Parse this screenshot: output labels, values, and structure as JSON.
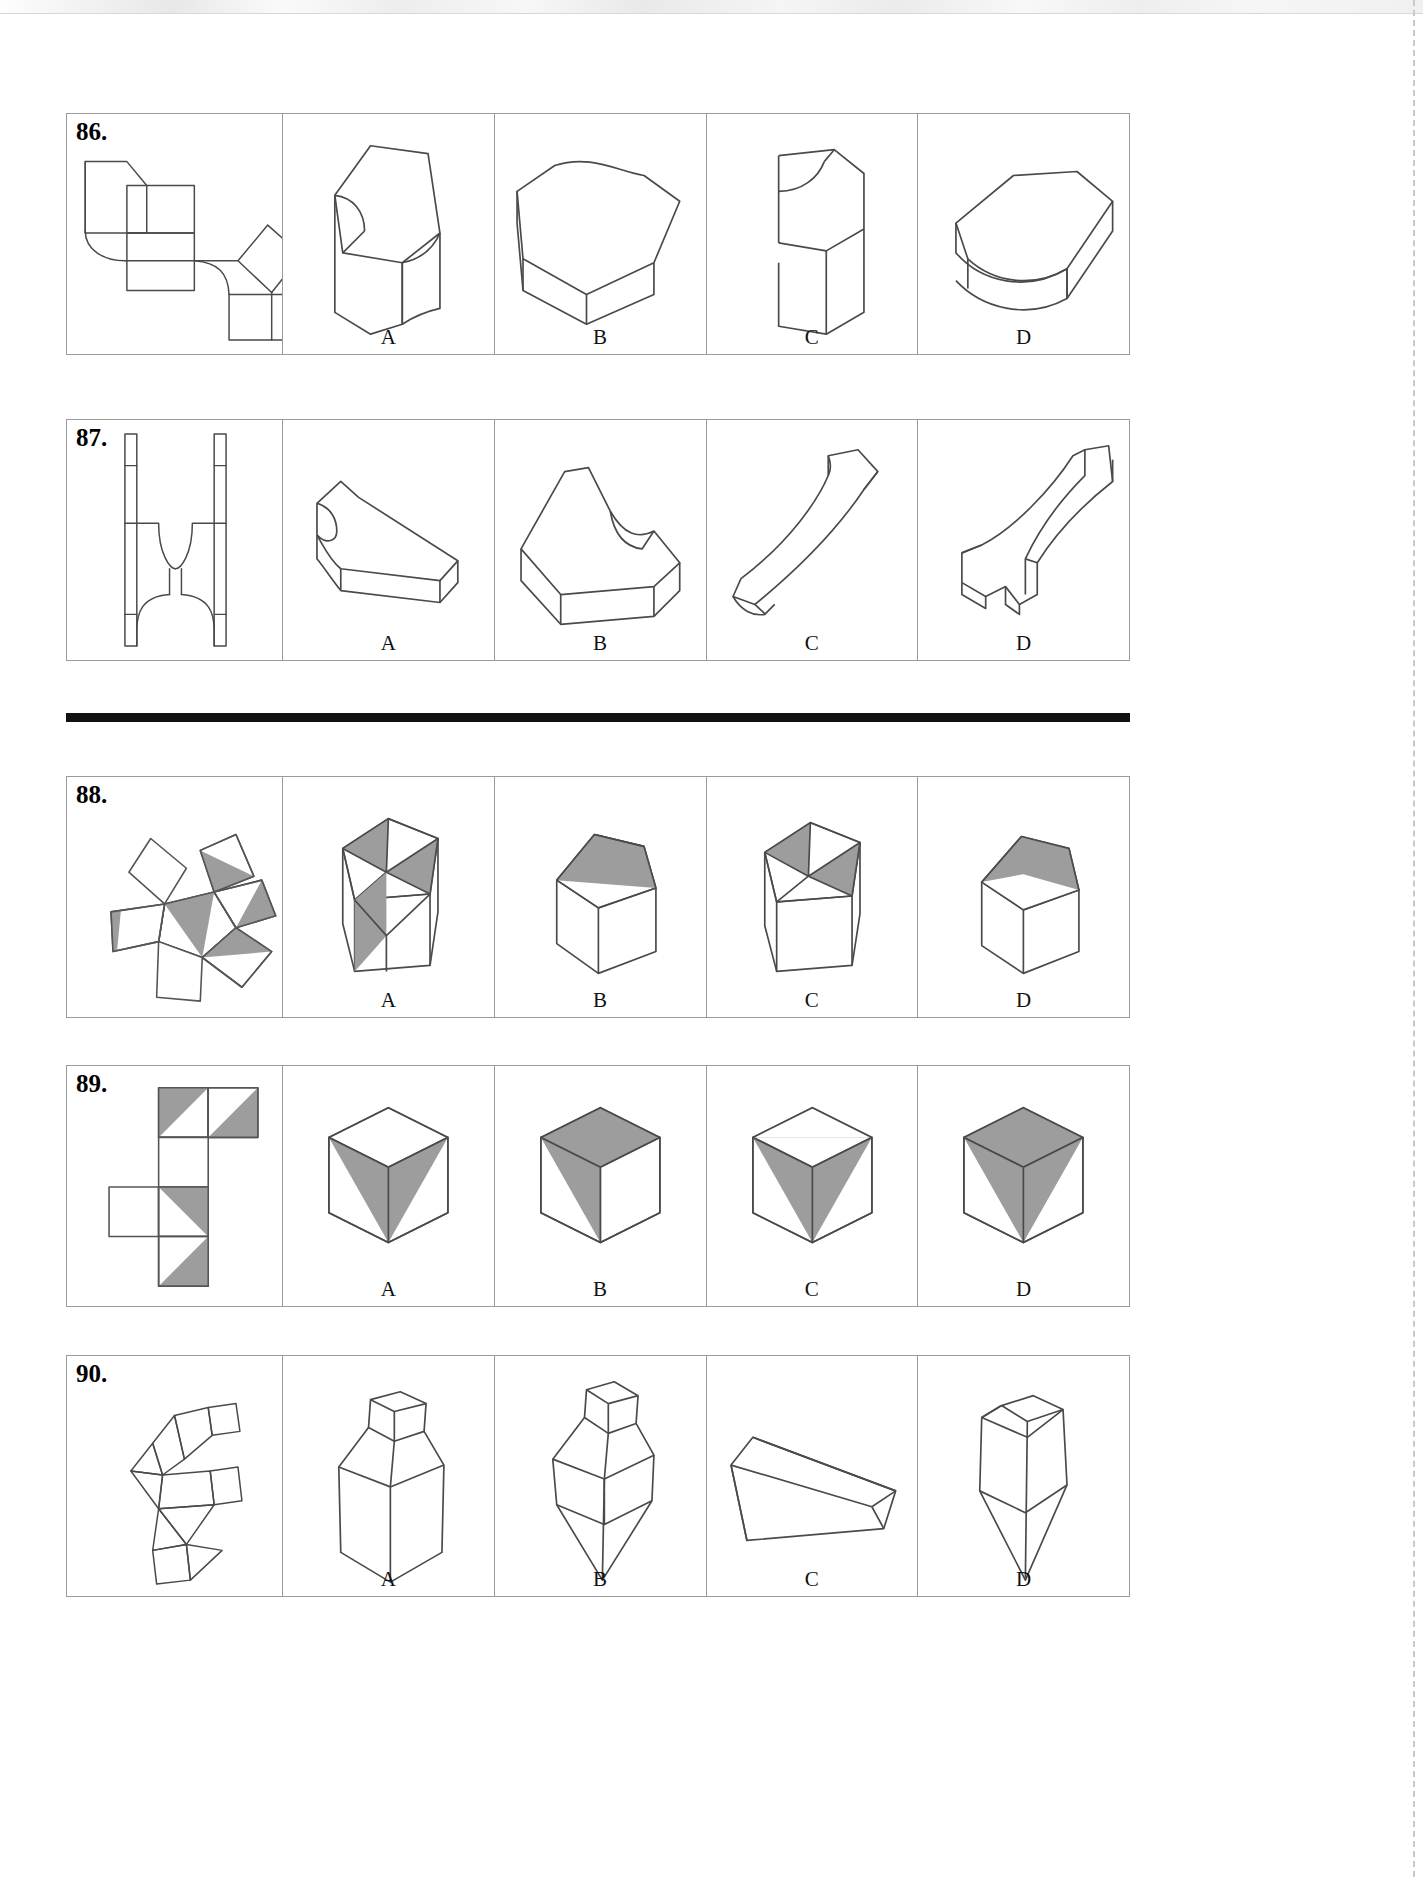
{
  "page": {
    "width": 1423,
    "height": 1877,
    "background": "#ffffff",
    "line_color": "#4a4a4a",
    "shade_color": "#9d9d9d",
    "rule_color": "#111111",
    "has_top_scan_band": true,
    "has_right_perforation": true
  },
  "option_labels": [
    "A",
    "B",
    "C",
    "D"
  ],
  "separators": [
    {
      "name": "thick-rule-between-87-and-88",
      "y": 713
    }
  ],
  "problems": [
    {
      "number": "86.",
      "y": 113,
      "height": 242,
      "stem_kind": "flat-pattern",
      "stem_description": "unfolded net of a solid with a rounded concave cut, composed of squares with one curved corner and a diamond flap",
      "options": [
        {
          "label": "A",
          "description": "upright block with a concave rounded notch on the front-left face"
        },
        {
          "label": "B",
          "description": "flat slab seen from above with a hexagonal outline and curved top"
        },
        {
          "label": "C",
          "description": "tall narrow box with a small rounded notch cut from the top left"
        },
        {
          "label": "D",
          "description": "wide flat slab with a large concave curved bite out of the near face"
        }
      ]
    },
    {
      "number": "87.",
      "y": 419,
      "height": 242,
      "stem_kind": "flat-pattern",
      "stem_description": "H-shaped net with two vertical side rails, a semicircular concave notch at the top, a narrow connecting band, and a rounded lobe below",
      "options": [
        {
          "label": "A",
          "description": "low flat bar with an S-curve profile on the left end, viewed from above"
        },
        {
          "label": "B",
          "description": "thick wedge bar with a stepped ogee curve in the middle, viewed from above"
        },
        {
          "label": "C",
          "description": "tall curved blade sweeping down to the left, viewed edge on"
        },
        {
          "label": "D",
          "description": "hook-shaped bracket with an S-curve arm rising to the upper right"
        }
      ]
    },
    {
      "number": "88.",
      "y": 776,
      "height": 242,
      "stem_kind": "shaded-net",
      "stem_description": "net of a pentagonal prism: a central pentagon with five square flaps, several faces half-shaded gray along the diagonal",
      "options": [
        {
          "label": "A",
          "description": "pentagonal prism seen from above-front, top pentagon split into alternating white and gray triangles"
        },
        {
          "label": "B",
          "description": "pentagonal prism tilted, gray band across the top face"
        },
        {
          "label": "C",
          "description": "pentagonal prism with gray wedges on the top face meeting at the centre"
        },
        {
          "label": "D",
          "description": "pentagonal prism, mostly gray top face with a white triangle"
        }
      ]
    },
    {
      "number": "89.",
      "y": 1065,
      "height": 242,
      "stem_kind": "shaded-net",
      "stem_description": "cube net laid out as a vertical strip of four squares with one square to the left, several squares diagonally half-shaded gray",
      "options": [
        {
          "label": "A",
          "description": "cube with a gray V (chevron) formed by two shaded triangles on the two front faces"
        },
        {
          "label": "B",
          "description": "cube with gray top face and a gray triangle on the front-left face"
        },
        {
          "label": "C",
          "description": "cube with gray inverted triangle on the front faces and white top"
        },
        {
          "label": "D",
          "description": "cube with gray top face and gray triangles pointing down on both front faces"
        }
      ]
    },
    {
      "number": "90.",
      "y": 1355,
      "height": 242,
      "stem_kind": "flat-pattern",
      "stem_description": "tall irregular net made of squares, triangles and a small square tab, used to build a capped polyhedron",
      "options": [
        {
          "label": "A",
          "description": "tall polyhedron with a small square cap on top of a hexagonal barrel"
        },
        {
          "label": "B",
          "description": "polyhedron with small cube cap and a faceted diamond-shaped body"
        },
        {
          "label": "C",
          "description": "long flat open box / trough seen in perspective from above"
        },
        {
          "label": "D",
          "description": "elongated hexagonal barrel with a flat top and vertical centre edge"
        }
      ]
    }
  ]
}
